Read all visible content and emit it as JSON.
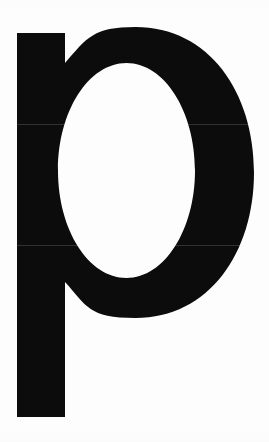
{
  "image": {
    "kind": "scanned-letterform",
    "glyph": "p",
    "script": "latin",
    "case": "lowercase",
    "description": "Large black lowercase letter p on a white background",
    "width": 269,
    "height": 442
  },
  "colors": {
    "background": "#fdfdfd",
    "ink": "#0d0c0c",
    "counter": "#ffffff",
    "seam": "#6e6c6c"
  },
  "geometry": {
    "stem": {
      "x": 17,
      "y": 33,
      "width": 48,
      "height": 384
    },
    "bowl_outer": {
      "left": 17,
      "top": 27,
      "right": 254,
      "bottom": 318
    },
    "counter": {
      "left": 58,
      "top": 63,
      "right": 195,
      "bottom": 278
    }
  },
  "artifacts": {
    "seam_upper_y": 124,
    "seam_lower_y": 245
  },
  "caption": "p"
}
